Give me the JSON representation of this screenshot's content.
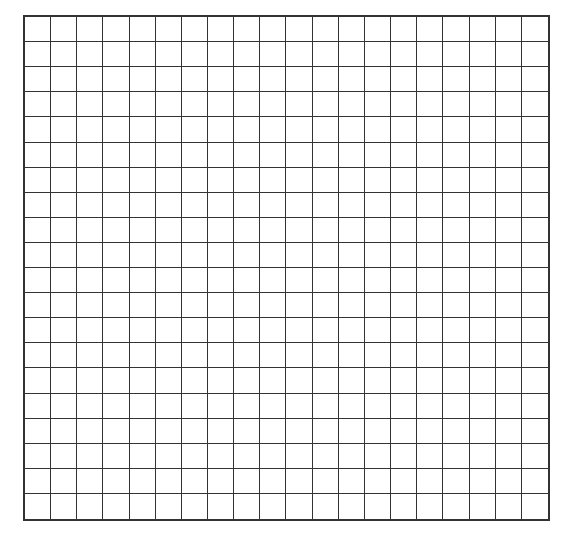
{
  "grid": {
    "rows": 20,
    "columns": 20,
    "cell_width_px": 26.3,
    "cell_height_px": 25.25,
    "line_color": "#333333",
    "background_color": "#ffffff",
    "cells_filled": []
  }
}
